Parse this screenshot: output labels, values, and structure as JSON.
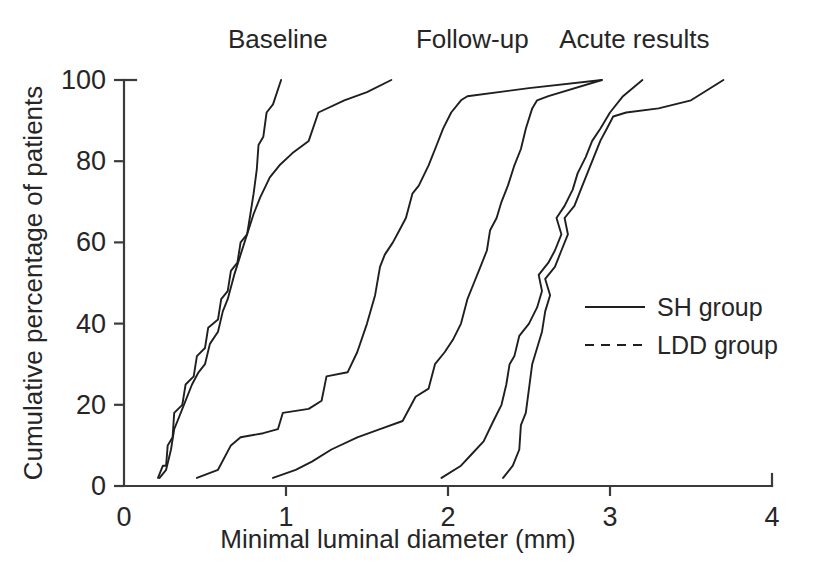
{
  "chart_data": {
    "type": "line",
    "title": "",
    "xlabel": "Minimal luminal diameter (mm)",
    "ylabel": "Cumulative percentage of patients",
    "xlim": [
      0,
      4
    ],
    "ylim": [
      0,
      100
    ],
    "xticks": [
      "0",
      "1",
      "2",
      "3",
      "4"
    ],
    "xtick_values": [
      0,
      1,
      2,
      3,
      4
    ],
    "yticks": [
      "0",
      "20",
      "40",
      "60",
      "80",
      "100"
    ],
    "ytick_values": [
      0,
      20,
      40,
      60,
      80,
      100
    ],
    "grid": false,
    "legend_position": "right-middle",
    "legend": [
      {
        "name": "SH group",
        "style": "solid"
      },
      {
        "name": "LDD group",
        "style": "dashed"
      }
    ],
    "panel_labels": [
      {
        "text": "Baseline",
        "x": 0.95
      },
      {
        "text": "Follow-up",
        "x": 2.15
      },
      {
        "text": "Acute results",
        "x": 3.15
      }
    ],
    "series": [
      {
        "name": "Baseline LDD group",
        "panel": "Baseline",
        "group": "LDD group",
        "style": "dashed",
        "points": [
          [
            0.21,
            2
          ],
          [
            0.24,
            5
          ],
          [
            0.26,
            5
          ],
          [
            0.27,
            10
          ],
          [
            0.3,
            12
          ],
          [
            0.31,
            18
          ],
          [
            0.36,
            20
          ],
          [
            0.38,
            25
          ],
          [
            0.43,
            27
          ],
          [
            0.45,
            32
          ],
          [
            0.5,
            34
          ],
          [
            0.52,
            39
          ],
          [
            0.58,
            41
          ],
          [
            0.6,
            46
          ],
          [
            0.64,
            48
          ],
          [
            0.66,
            53
          ],
          [
            0.7,
            55
          ],
          [
            0.72,
            60
          ],
          [
            0.76,
            62
          ],
          [
            0.78,
            67
          ],
          [
            0.8,
            72
          ],
          [
            0.82,
            78
          ],
          [
            0.83,
            84
          ],
          [
            0.86,
            86
          ],
          [
            0.88,
            92
          ],
          [
            0.92,
            94
          ],
          [
            0.97,
            100
          ]
        ]
      },
      {
        "name": "Baseline SH group",
        "panel": "Baseline",
        "group": "SH group",
        "style": "solid",
        "points": [
          [
            0.22,
            2
          ],
          [
            0.26,
            4
          ],
          [
            0.29,
            9
          ],
          [
            0.31,
            14
          ],
          [
            0.33,
            16
          ],
          [
            0.38,
            21
          ],
          [
            0.42,
            25
          ],
          [
            0.46,
            28
          ],
          [
            0.5,
            30
          ],
          [
            0.53,
            35
          ],
          [
            0.58,
            38
          ],
          [
            0.61,
            43
          ],
          [
            0.64,
            46
          ],
          [
            0.68,
            52
          ],
          [
            0.72,
            57
          ],
          [
            0.76,
            62
          ],
          [
            0.8,
            67
          ],
          [
            0.84,
            71
          ],
          [
            0.9,
            76
          ],
          [
            0.96,
            79
          ],
          [
            1.04,
            82
          ],
          [
            1.14,
            85
          ],
          [
            1.2,
            92
          ],
          [
            1.36,
            95
          ],
          [
            1.5,
            97
          ],
          [
            1.65,
            100
          ]
        ]
      },
      {
        "name": "Follow-up LDD group",
        "panel": "Follow-up",
        "group": "LDD group",
        "style": "dashed",
        "points": [
          [
            0.45,
            2
          ],
          [
            0.58,
            4
          ],
          [
            0.66,
            10
          ],
          [
            0.72,
            12
          ],
          [
            0.86,
            13
          ],
          [
            0.95,
            14
          ],
          [
            0.98,
            18
          ],
          [
            1.14,
            19
          ],
          [
            1.22,
            21
          ],
          [
            1.25,
            27
          ],
          [
            1.38,
            28
          ],
          [
            1.44,
            33
          ],
          [
            1.5,
            40
          ],
          [
            1.55,
            47
          ],
          [
            1.58,
            54
          ],
          [
            1.61,
            57
          ],
          [
            1.66,
            60
          ],
          [
            1.7,
            63
          ],
          [
            1.74,
            66
          ],
          [
            1.78,
            72
          ],
          [
            1.82,
            74
          ],
          [
            1.88,
            79
          ],
          [
            1.93,
            84
          ],
          [
            1.97,
            88
          ],
          [
            2.02,
            92
          ],
          [
            2.08,
            95
          ],
          [
            2.12,
            96
          ],
          [
            2.5,
            98
          ],
          [
            2.95,
            100
          ]
        ]
      },
      {
        "name": "Follow-up SH group",
        "panel": "Follow-up",
        "group": "SH group",
        "style": "solid",
        "points": [
          [
            0.92,
            2
          ],
          [
            1.06,
            4
          ],
          [
            1.16,
            6
          ],
          [
            1.28,
            9
          ],
          [
            1.44,
            12
          ],
          [
            1.58,
            14
          ],
          [
            1.72,
            16
          ],
          [
            1.8,
            22
          ],
          [
            1.88,
            24
          ],
          [
            1.92,
            30
          ],
          [
            1.98,
            33
          ],
          [
            2.03,
            36
          ],
          [
            2.08,
            40
          ],
          [
            2.12,
            46
          ],
          [
            2.16,
            50
          ],
          [
            2.2,
            54
          ],
          [
            2.24,
            58
          ],
          [
            2.26,
            63
          ],
          [
            2.3,
            66
          ],
          [
            2.33,
            70
          ],
          [
            2.37,
            74
          ],
          [
            2.41,
            79
          ],
          [
            2.45,
            83
          ],
          [
            2.48,
            88
          ],
          [
            2.52,
            93
          ],
          [
            2.55,
            95
          ],
          [
            2.62,
            96
          ],
          [
            2.95,
            100
          ]
        ]
      },
      {
        "name": "Acute LDD group",
        "panel": "Acute results",
        "group": "LDD group",
        "style": "dashed",
        "points": [
          [
            1.96,
            2
          ],
          [
            2.08,
            5
          ],
          [
            2.15,
            8
          ],
          [
            2.22,
            11
          ],
          [
            2.28,
            16
          ],
          [
            2.33,
            20
          ],
          [
            2.36,
            25
          ],
          [
            2.38,
            30
          ],
          [
            2.41,
            32
          ],
          [
            2.44,
            37
          ],
          [
            2.5,
            40
          ],
          [
            2.55,
            44
          ],
          [
            2.58,
            48
          ],
          [
            2.56,
            52
          ],
          [
            2.62,
            55
          ],
          [
            2.66,
            58
          ],
          [
            2.7,
            62
          ],
          [
            2.67,
            66
          ],
          [
            2.72,
            69
          ],
          [
            2.77,
            73
          ],
          [
            2.8,
            77
          ],
          [
            2.85,
            81
          ],
          [
            2.89,
            85
          ],
          [
            2.94,
            88
          ],
          [
            3.0,
            92
          ],
          [
            3.08,
            96
          ],
          [
            3.2,
            100
          ]
        ]
      },
      {
        "name": "Acute SH group",
        "panel": "Acute results",
        "group": "SH group",
        "style": "solid",
        "points": [
          [
            2.34,
            2
          ],
          [
            2.4,
            5
          ],
          [
            2.44,
            9
          ],
          [
            2.45,
            15
          ],
          [
            2.48,
            18
          ],
          [
            2.5,
            24
          ],
          [
            2.52,
            30
          ],
          [
            2.55,
            34
          ],
          [
            2.58,
            38
          ],
          [
            2.6,
            43
          ],
          [
            2.63,
            47
          ],
          [
            2.6,
            51
          ],
          [
            2.66,
            54
          ],
          [
            2.7,
            58
          ],
          [
            2.74,
            62
          ],
          [
            2.72,
            66
          ],
          [
            2.78,
            69
          ],
          [
            2.82,
            73
          ],
          [
            2.86,
            77
          ],
          [
            2.9,
            81
          ],
          [
            2.94,
            85
          ],
          [
            2.98,
            88
          ],
          [
            3.02,
            91
          ],
          [
            3.1,
            92
          ],
          [
            3.3,
            93
          ],
          [
            3.5,
            95
          ],
          [
            3.7,
            100
          ]
        ]
      }
    ]
  }
}
